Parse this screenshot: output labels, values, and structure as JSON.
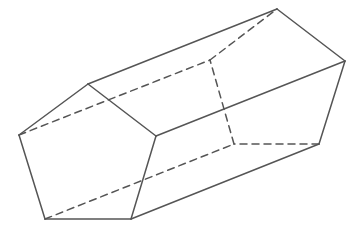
{
  "diagram": {
    "stroke_color": "#555555",
    "background_color": "#ffffff",
    "stroke_width": 1.5,
    "dash_pattern": "7,5",
    "vertices": {
      "F1": [
        88,
        84
      ],
      "F2": [
        156,
        136
      ],
      "F3": [
        131,
        219
      ],
      "F4": [
        45,
        219
      ],
      "F5": [
        19,
        135
      ],
      "B1": [
        277,
        9
      ],
      "B2": [
        345,
        61
      ],
      "B3": [
        319,
        144
      ],
      "B4": [
        234,
        144
      ],
      "B5": [
        210,
        60
      ]
    },
    "solid_edges": [
      [
        "F1",
        "F2"
      ],
      [
        "F2",
        "F3"
      ],
      [
        "F3",
        "F4"
      ],
      [
        "F4",
        "F5"
      ],
      [
        "F5",
        "F1"
      ],
      [
        "F1",
        "B1"
      ],
      [
        "F2",
        "B2"
      ],
      [
        "F3",
        "B3"
      ],
      [
        "B1",
        "B2"
      ],
      [
        "B2",
        "B3"
      ]
    ],
    "hidden_edges": [
      [
        "F5",
        "B5"
      ],
      [
        "F4",
        "B4"
      ],
      [
        "B3",
        "B4"
      ],
      [
        "B4",
        "B5"
      ],
      [
        "B5",
        "B1"
      ]
    ]
  }
}
